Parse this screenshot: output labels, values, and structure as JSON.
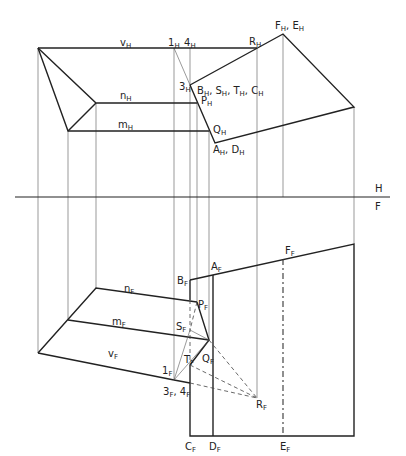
{
  "diagram": {
    "fold_line": {
      "above": "H",
      "below": "F"
    },
    "labels_top": [
      {
        "id": "vH",
        "base": "v",
        "sub": "H",
        "x": 120,
        "y": 38
      },
      {
        "id": "1H",
        "base": "1",
        "sub": "H",
        "x": 168,
        "y": 38
      },
      {
        "id": "4H",
        "base": "4",
        "sub": "H",
        "x": 184,
        "y": 38
      },
      {
        "id": "RH",
        "base": "R",
        "sub": "H",
        "x": 249,
        "y": 37
      },
      {
        "id": "FHEH",
        "base": "F",
        "sub": "H",
        "extra_base": ", E",
        "extra_sub": "H",
        "x": 275,
        "y": 21
      },
      {
        "id": "3H",
        "base": "3",
        "sub": "H",
        "x": 179,
        "y": 82
      },
      {
        "id": "BSTC",
        "base": "B",
        "sub": "H",
        "extra_text": ", S_H, T_H, C_H",
        "x": 197,
        "y": 86
      },
      {
        "id": "PH",
        "base": "P",
        "sub": "H",
        "x": 201,
        "y": 96
      },
      {
        "id": "nH",
        "base": "n",
        "sub": "H",
        "x": 120,
        "y": 91
      },
      {
        "id": "mH",
        "base": "m",
        "sub": "H",
        "x": 118,
        "y": 120
      },
      {
        "id": "QH",
        "base": "Q",
        "sub": "H",
        "x": 213,
        "y": 125
      },
      {
        "id": "AHDH",
        "base": "A",
        "sub": "H",
        "extra_base": ", D",
        "extra_sub": "H",
        "x": 213,
        "y": 145
      }
    ],
    "labels_front": [
      {
        "id": "BF",
        "base": "B",
        "sub": "F",
        "x": 177,
        "y": 276
      },
      {
        "id": "AF",
        "base": "A",
        "sub": "F",
        "x": 211,
        "y": 262
      },
      {
        "id": "FF",
        "base": "F",
        "sub": "F",
        "x": 285,
        "y": 246
      },
      {
        "id": "PF",
        "base": "P",
        "sub": "F",
        "x": 198,
        "y": 300
      },
      {
        "id": "nF",
        "base": "n",
        "sub": "F",
        "x": 124,
        "y": 284
      },
      {
        "id": "mF",
        "base": "m",
        "sub": "F",
        "x": 112,
        "y": 317
      },
      {
        "id": "SF",
        "base": "S",
        "sub": "F",
        "x": 176,
        "y": 322
      },
      {
        "id": "vF",
        "base": "v",
        "sub": "F",
        "x": 108,
        "y": 349
      },
      {
        "id": "TF",
        "base": "T",
        "sub": "F",
        "x": 184,
        "y": 355
      },
      {
        "id": "QF",
        "base": "Q",
        "sub": "F",
        "x": 202,
        "y": 354
      },
      {
        "id": "1F",
        "base": "1",
        "sub": "F",
        "x": 162,
        "y": 366
      },
      {
        "id": "34F",
        "base": "3",
        "sub": "F",
        "extra_base": ", 4",
        "extra_sub": "F",
        "x": 163,
        "y": 387
      },
      {
        "id": "RF",
        "base": "R",
        "sub": "F",
        "x": 256,
        "y": 400
      },
      {
        "id": "CF",
        "base": "C",
        "sub": "F",
        "x": 185,
        "y": 442
      },
      {
        "id": "DF",
        "base": "D",
        "sub": "F",
        "x": 209,
        "y": 442
      },
      {
        "id": "EF",
        "base": "E",
        "sub": "F",
        "x": 280,
        "y": 442
      }
    ],
    "fold_labels": {
      "H": "H",
      "F": "F"
    }
  }
}
